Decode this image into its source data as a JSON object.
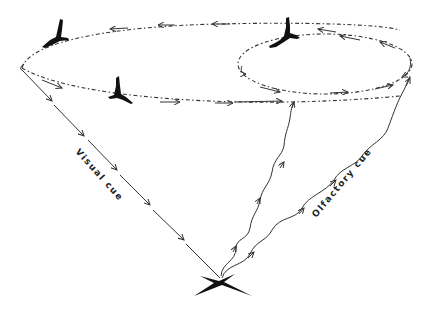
{
  "figure": {
    "labels": {
      "visual_cue": "Visual cue",
      "olfactory_cue": "Olfactory cue"
    },
    "elements": {
      "large_circuit": "large elliptical flight path (counter-clockwise arrows)",
      "small_circuit": "small elliptical flight path on right",
      "birds": 3,
      "carcass": "black X-shaped target at bottom center",
      "visual_cue_line": "straight arrowed line from left end of large ellipse to carcass",
      "olfactory_cue_lines": 2
    },
    "colors": {
      "ink": "#111111",
      "background": "#ffffff"
    }
  }
}
